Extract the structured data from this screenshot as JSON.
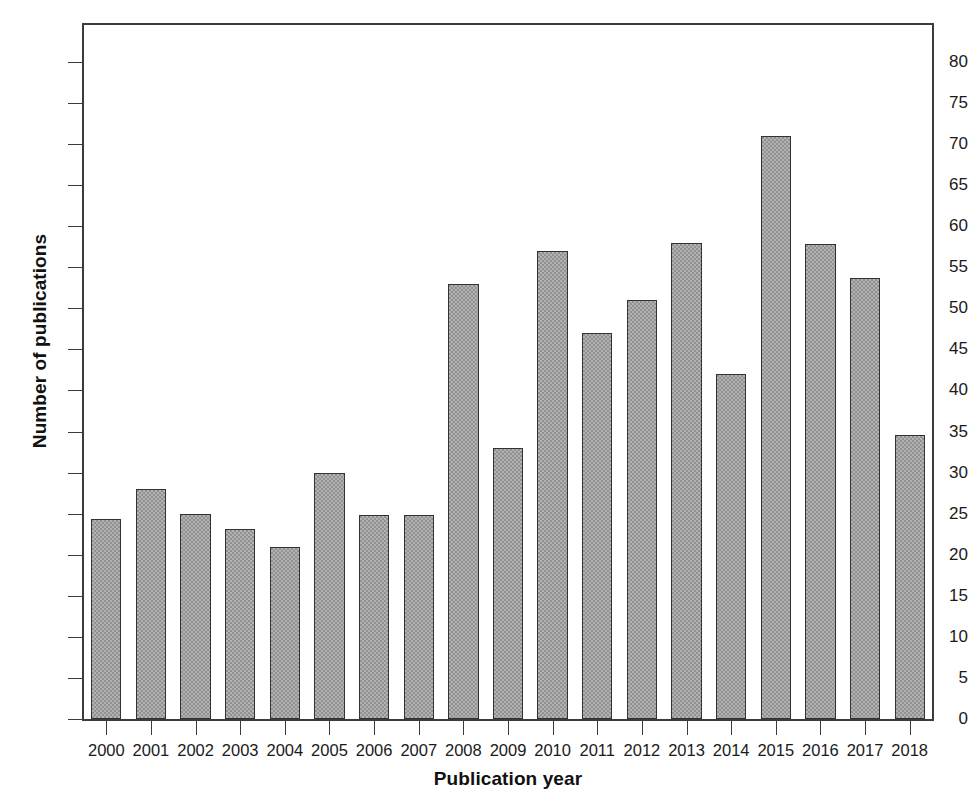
{
  "chart_data": {
    "type": "bar",
    "title": "",
    "xlabel": "Publication year",
    "ylabel": "Number of publications",
    "categories": [
      "2000",
      "2001",
      "2002",
      "2003",
      "2004",
      "2005",
      "2006",
      "2007",
      "2008",
      "2009",
      "2010",
      "2011",
      "2012",
      "2013",
      "2014",
      "2015",
      "2016",
      "2017",
      "2018"
    ],
    "values": [
      24.3,
      28.0,
      25.0,
      23.1,
      21.0,
      29.9,
      24.9,
      24.8,
      53.0,
      33.0,
      57.0,
      47.0,
      51.0,
      58.0,
      42.0,
      71.0,
      57.8,
      53.7,
      34.6
    ],
    "ylim": [
      0,
      84.5
    ],
    "xlim_categories": 19,
    "ytick_labels": [
      "0",
      "5",
      "10",
      "15",
      "20",
      "25",
      "30",
      "35",
      "40",
      "45",
      "50",
      "55",
      "60",
      "65",
      "70",
      "75",
      "80"
    ],
    "ytick_values": [
      0,
      5,
      10,
      15,
      20,
      25,
      30,
      35,
      40,
      45,
      50,
      55,
      60,
      65,
      70,
      75,
      80
    ],
    "grid": false,
    "legend": null,
    "legend_position": "none",
    "bar_fill_color": "#919191",
    "bar_edge_color": "#323232",
    "axis_color": "#3b3b3b",
    "background_color": "#ffffff"
  },
  "axes": {
    "x_title": "Publication year",
    "y_title": "Number of publications"
  }
}
